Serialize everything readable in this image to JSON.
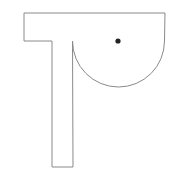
{
  "figure": {
    "width": 179,
    "height": 180,
    "background": "#ffffff",
    "stroke_color": "#8a8a8a",
    "dot_color": "#222222",
    "shape": {
      "description": "T-shaped outline with a semicircular lobe on the right and a dot",
      "top_bar": {
        "x1": 24,
        "y1": 13,
        "x2": 165,
        "y2": 13
      },
      "left_edge_top": {
        "x": 24,
        "y1": 13,
        "y2": 41
      },
      "stem": {
        "left_x": 52,
        "right_x": 73,
        "top_y": 41,
        "bottom_y": 167
      },
      "arc": {
        "cx": 118.5,
        "cy": 41,
        "r": 46,
        "start_x": 72.5,
        "end_x": 164.5
      }
    },
    "dot": {
      "cx": 118,
      "cy": 41,
      "r": 2.6
    }
  }
}
